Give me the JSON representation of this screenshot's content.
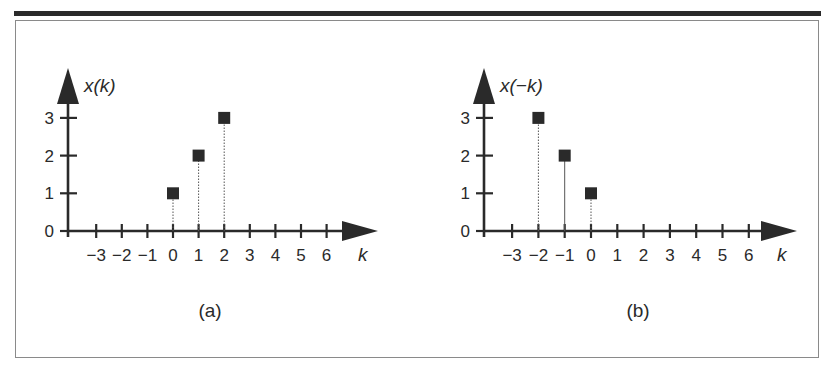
{
  "figure": {
    "panels": [
      {
        "id": "a",
        "caption": "(a)",
        "y_label": "x(k)",
        "x_label": "k"
      },
      {
        "id": "b",
        "caption": "(b)",
        "y_label": "x(−k)",
        "x_label": "k"
      }
    ],
    "x_tick_labels": [
      "−3",
      "−2",
      "−1",
      "0",
      "1",
      "2",
      "3",
      "4",
      "5",
      "6"
    ],
    "y_tick_labels": [
      "0",
      "1",
      "2",
      "3"
    ]
  },
  "chart_data": [
    {
      "type": "scatter",
      "subtype": "stem",
      "title": "(a)",
      "xlabel": "k",
      "ylabel": "x(k)",
      "x_ticks": [
        -3,
        -2,
        -1,
        0,
        1,
        2,
        3,
        4,
        5,
        6
      ],
      "y_ticks": [
        0,
        1,
        2,
        3
      ],
      "xlim": [
        -4,
        7
      ],
      "ylim": [
        0,
        3.5
      ],
      "grid": false,
      "series": [
        {
          "name": "x(k)",
          "x": [
            0,
            1,
            2
          ],
          "y": [
            1,
            2,
            3
          ]
        }
      ]
    },
    {
      "type": "scatter",
      "subtype": "stem",
      "title": "(b)",
      "xlabel": "k",
      "ylabel": "x(−k)",
      "x_ticks": [
        -3,
        -2,
        -1,
        0,
        1,
        2,
        3,
        4,
        5,
        6
      ],
      "y_ticks": [
        0,
        1,
        2,
        3
      ],
      "xlim": [
        -4,
        7
      ],
      "ylim": [
        0,
        3.5
      ],
      "grid": false,
      "series": [
        {
          "name": "x(−k)",
          "x": [
            -2,
            -1,
            0
          ],
          "y": [
            3,
            2,
            1
          ]
        }
      ]
    }
  ]
}
